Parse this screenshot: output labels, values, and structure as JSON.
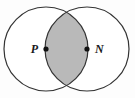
{
  "figure": {
    "background_color": "#fdfdfd",
    "stroke_color": "#333333",
    "shaded_region_color": "#b9b9b9",
    "point_marker_color": "#111111"
  },
  "chart_data": {
    "type": "diagram",
    "diagram_kind": "venn-two-circle",
    "title": "",
    "xlabel": "",
    "ylabel": "",
    "circles": [
      {
        "name": "left-circle",
        "center_label": "P",
        "cx": 46,
        "cy": 49,
        "r": 42,
        "fill": "#ffffff",
        "stroke": "#333333"
      },
      {
        "name": "right-circle",
        "center_label": "N",
        "cx": 87,
        "cy": 49,
        "r": 42,
        "fill": "#ffffff",
        "stroke": "#333333"
      }
    ],
    "shaded_regions": [
      {
        "name": "intersection-lens",
        "description": "lens-shaped intersection of the two circles",
        "fill": "#b9b9b9"
      }
    ],
    "points": [
      {
        "label": "P",
        "x": 46,
        "y": 49,
        "label_x": 38,
        "label_y": 53,
        "label_anchor": "end"
      },
      {
        "label": "N",
        "x": 87,
        "y": 49,
        "label_x": 95,
        "label_y": 53,
        "label_anchor": "start"
      }
    ],
    "intersection_points": [
      {
        "x": 67,
        "y": 6
      },
      {
        "x": 67,
        "y": 92
      }
    ],
    "annotations": []
  },
  "labels": {
    "point_p": "P",
    "point_n": "N"
  }
}
